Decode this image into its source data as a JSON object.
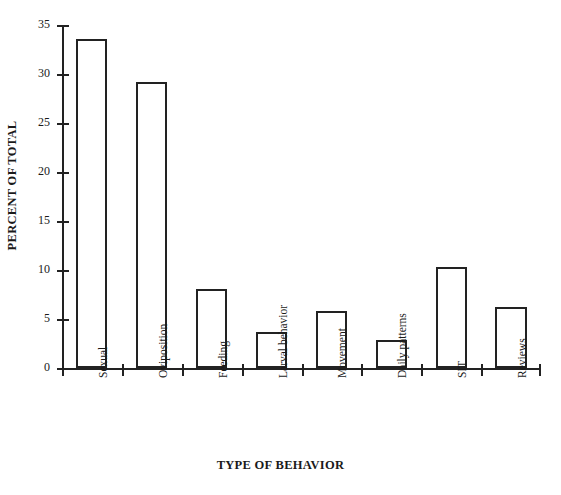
{
  "chart_data": {
    "type": "bar",
    "title": "",
    "xlabel": "TYPE OF BEHAVIOR",
    "ylabel": "PERCENT OF TOTAL",
    "categories": [
      "Sexual",
      "Oviposition",
      "Feeding",
      "Larval behavior",
      "Movement",
      "Daily patterns",
      "SIT",
      "Reviews"
    ],
    "values": [
      33.6,
      29.2,
      8.1,
      3.7,
      5.8,
      2.9,
      10.3,
      6.2
    ],
    "ylim": [
      0,
      35
    ],
    "yticks": [
      0,
      5,
      10,
      15,
      20,
      25,
      30,
      35
    ],
    "ytick_labels": [
      "0",
      "5",
      "10",
      "15",
      "20",
      "25",
      "30",
      "35"
    ],
    "grid": false,
    "legend": false,
    "bar_fill": "#ffffff",
    "bar_edge": "#222222",
    "axis_color": "#222222",
    "background": "#ffffff"
  }
}
